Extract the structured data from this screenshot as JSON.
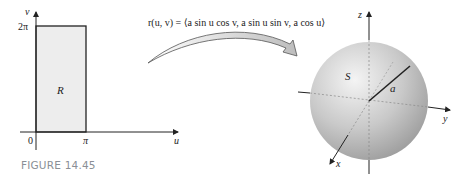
{
  "figure": {
    "caption": "FIGURE 14.45",
    "domain_plot": {
      "axis_v_label": "v",
      "axis_u_label": "u",
      "v_tick": "2π",
      "u_tick": "π",
      "origin_label": "0",
      "region_label": "R",
      "region_fill": "#ededed"
    },
    "mapping": {
      "formula": "r(u, v) = ⟨a sin u cos v, a sin u sin v, a cos u⟩"
    },
    "surface_plot": {
      "axis_x_label": "x",
      "axis_y_label": "y",
      "axis_z_label": "z",
      "surface_label": "S",
      "radius_label": "a",
      "sphere_color": "#c8c8c8"
    }
  }
}
